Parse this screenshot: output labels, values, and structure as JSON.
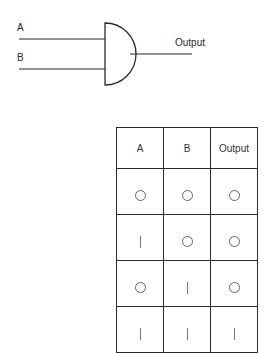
{
  "diagram": {
    "gate_type": "AND",
    "inputs": [
      {
        "label": "A"
      },
      {
        "label": "B"
      }
    ],
    "output_label": "Output"
  },
  "truth_table": {
    "headers": [
      "A",
      "B",
      "Output"
    ],
    "rows": [
      [
        "0",
        "0",
        "0"
      ],
      [
        "1",
        "0",
        "0"
      ],
      [
        "0",
        "1",
        "0"
      ],
      [
        "1",
        "1",
        "1"
      ]
    ]
  }
}
